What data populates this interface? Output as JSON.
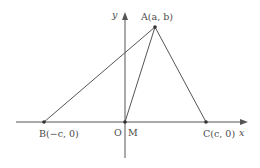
{
  "diagram": {
    "type": "coordinate-geometry",
    "axes": {
      "x_label": "x",
      "y_label": "y",
      "origin_label": "O"
    },
    "points": {
      "A": {
        "name": "A",
        "coords": "(a, b)",
        "label": "A(a, b)"
      },
      "B": {
        "name": "B",
        "coords": "(−c, 0)",
        "label": "B(−c, 0)"
      },
      "C": {
        "name": "C",
        "coords": "(c, 0)",
        "label": "C(c, 0)"
      },
      "M": {
        "name": "M",
        "label": "M"
      }
    },
    "segments": [
      "AB",
      "AC",
      "AM",
      "BC"
    ],
    "colors": {
      "line": "#555555",
      "text": "#4a4a4a"
    }
  }
}
